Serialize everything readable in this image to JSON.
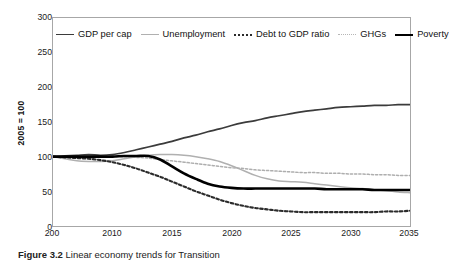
{
  "figure": {
    "caption_label": "Figure 3.2",
    "caption_rest": "Linear economy trends for Transition"
  },
  "chart_data": {
    "type": "line",
    "title": "",
    "xlabel": "",
    "ylabel": "2005 = 100",
    "xlim": [
      2005,
      2035
    ],
    "ylim": [
      0,
      300
    ],
    "grid": false,
    "legend_position": "top-left-inside",
    "x_tick_labels": [
      "200",
      "2010",
      "2015",
      "2020",
      "2025",
      "2030",
      "2035"
    ],
    "x_ticks": [
      2005,
      2010,
      2015,
      2020,
      2025,
      2030,
      2035
    ],
    "y_ticks": [
      0,
      50,
      100,
      150,
      200,
      250,
      300
    ],
    "y_tick_labels": [
      "0",
      "50",
      "100",
      "150",
      "200",
      "250",
      "300"
    ],
    "x": [
      2005,
      2006,
      2007,
      2008,
      2009,
      2010,
      2011,
      2012,
      2013,
      2014,
      2015,
      2016,
      2017,
      2018,
      2019,
      2020,
      2021,
      2022,
      2023,
      2024,
      2025,
      2026,
      2027,
      2028,
      2029,
      2030,
      2031,
      2032,
      2033,
      2034,
      2035
    ],
    "series": [
      {
        "name": "GDP per cap",
        "color": "#3b3b3b",
        "style": "solid",
        "width": 1.7,
        "values": [
          100,
          101,
          102,
          103,
          102,
          103,
          106,
          110,
          114,
          118,
          122,
          127,
          131,
          136,
          140,
          145,
          149,
          152,
          156,
          159,
          162,
          165,
          167,
          169,
          171,
          172,
          173,
          174,
          174,
          175,
          175
        ]
      },
      {
        "name": "Unemployment",
        "color": "#b0b0b0",
        "style": "solid",
        "width": 1.5,
        "values": [
          100,
          97,
          94,
          93,
          93,
          94,
          97,
          100,
          102,
          103,
          103,
          102,
          100,
          97,
          93,
          87,
          80,
          73,
          68,
          65,
          64,
          63,
          61,
          59,
          57,
          55,
          54,
          52,
          51,
          49,
          48
        ]
      },
      {
        "name": "Debt to GDP ratio",
        "color": "#2b2b2b",
        "style": "dotted-bold",
        "width": 2.1,
        "values": [
          100,
          99,
          98,
          97,
          95,
          92,
          88,
          83,
          77,
          71,
          64,
          57,
          50,
          44,
          38,
          33,
          29,
          26,
          24,
          22,
          21,
          20,
          20,
          20,
          20,
          20,
          20,
          20,
          21,
          21,
          22
        ]
      },
      {
        "name": "GHGs",
        "color": "#aeaeae",
        "style": "dotted-fine",
        "width": 1.5,
        "values": [
          100,
          100,
          100,
          100,
          100,
          100,
          100,
          99,
          98,
          96,
          94,
          92,
          90,
          88,
          86,
          84,
          83,
          81,
          80,
          79,
          78,
          77,
          77,
          76,
          76,
          75,
          75,
          74,
          74,
          73,
          73
        ]
      },
      {
        "name": "Poverty",
        "color": "#000000",
        "style": "solid",
        "width": 2.6,
        "values": [
          100,
          100,
          100,
          100,
          100,
          100,
          101,
          101,
          101,
          96,
          86,
          76,
          68,
          61,
          57,
          55,
          54,
          54,
          54,
          54,
          54,
          54,
          54,
          53,
          53,
          53,
          53,
          52,
          52,
          52,
          52
        ]
      }
    ]
  },
  "legend": {
    "items": [
      {
        "label": "GDP per cap"
      },
      {
        "label": "Unemployment"
      },
      {
        "label": "Debt to GDP ratio"
      },
      {
        "label": "GHGs"
      },
      {
        "label": "Poverty"
      }
    ]
  }
}
